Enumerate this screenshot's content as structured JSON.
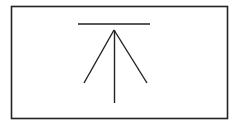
{
  "diagram": {
    "colors": {
      "background": "#ffffff",
      "stroke": "#222222"
    },
    "elements": [
      {
        "name": "frame",
        "kind": "rectangle"
      },
      {
        "name": "top-bar",
        "kind": "line"
      },
      {
        "name": "arrow-left-barb",
        "kind": "line"
      },
      {
        "name": "arrow-right-barb",
        "kind": "line"
      },
      {
        "name": "arrow-shaft",
        "kind": "line"
      }
    ]
  }
}
